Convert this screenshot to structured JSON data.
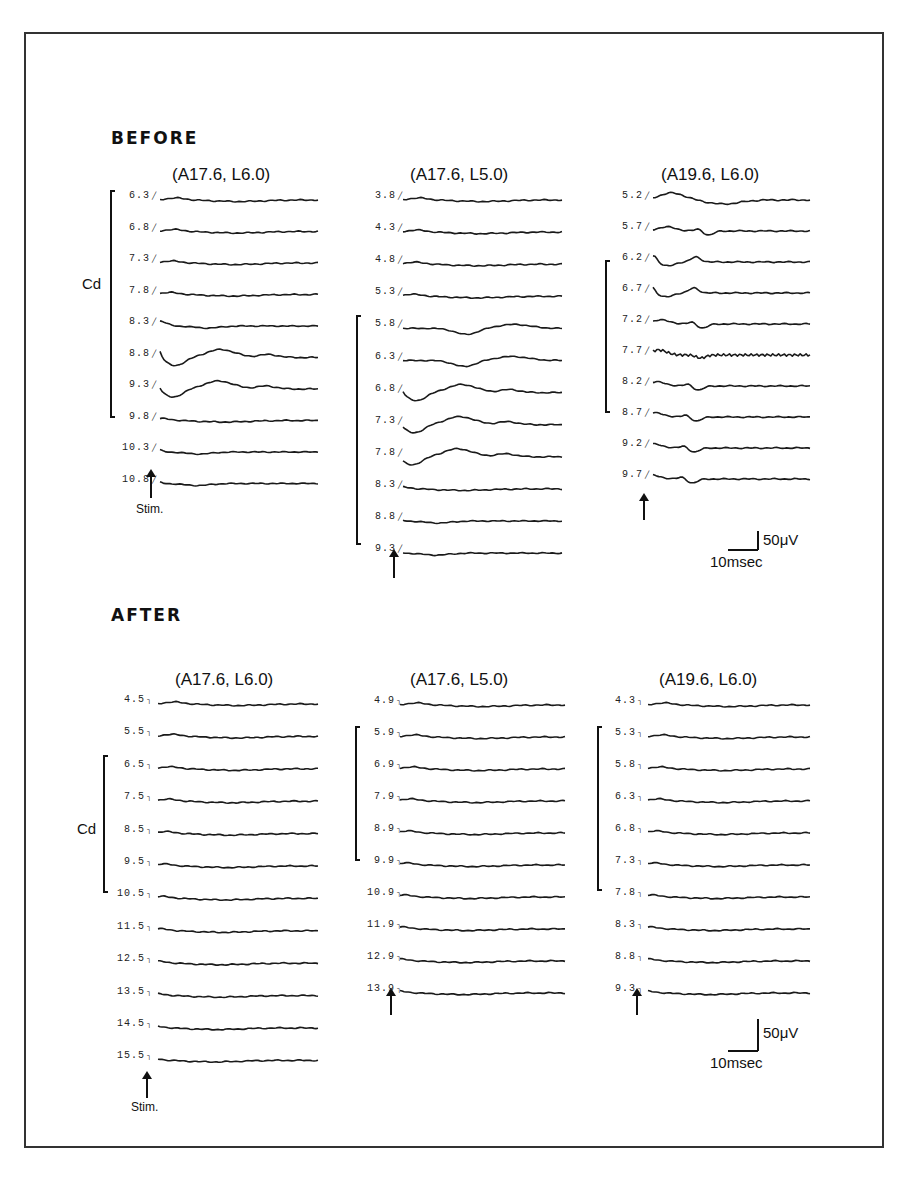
{
  "figure": {
    "sections": [
      {
        "id": "before",
        "title": "BEFORE",
        "columns": [
          {
            "title": "(A17.6, L6.0)",
            "labels": [
              "6.3",
              "6.8",
              "7.3",
              "7.8",
              "8.3",
              "8.8",
              "9.3",
              "9.8",
              "10.3",
              "10.8"
            ],
            "cd_bracket": {
              "from": 0,
              "to": 7
            },
            "cd_label": "Cd",
            "stim_label": "Stim.",
            "response": [
              "flat",
              "flat",
              "flat",
              "flat",
              "small",
              "large",
              "large",
              "flat",
              "small",
              "small"
            ]
          },
          {
            "title": "(A17.6, L5.0)",
            "labels": [
              "3.8",
              "4.3",
              "4.8",
              "5.3",
              "5.8",
              "6.3",
              "6.8",
              "7.3",
              "7.8",
              "8.3",
              "8.8",
              "9.3"
            ],
            "cd_bracket": {
              "from": 4,
              "to": 11
            },
            "response": [
              "flat",
              "flat",
              "flat",
              "flat",
              "dip",
              "dip",
              "large",
              "large",
              "large",
              "flat",
              "small",
              "small"
            ]
          },
          {
            "title": "(A19.6, L6.0)",
            "labels": [
              "5.2",
              "5.7",
              "6.2",
              "6.7",
              "7.2",
              "7.7",
              "8.2",
              "8.7",
              "9.2",
              "9.7"
            ],
            "cd_bracket": {
              "from": 2,
              "to": 7
            },
            "response": [
              "broad",
              "notch",
              "double",
              "double",
              "notch",
              "noisy",
              "notch",
              "notch",
              "notch",
              "notch"
            ]
          }
        ],
        "scale_bar": {
          "amplitude": "50μV",
          "time": "10msec"
        }
      },
      {
        "id": "after",
        "title": "AFTER",
        "columns": [
          {
            "title": "(A17.6, L6.0)",
            "labels": [
              "4.5",
              "5.5",
              "6.5",
              "7.5",
              "8.5",
              "9.5",
              "10.5",
              "11.5",
              "12.5",
              "13.5",
              "14.5",
              "15.5"
            ],
            "cd_bracket": {
              "from": 2,
              "to": 6
            },
            "cd_label": "Cd",
            "stim_label": "Stim."
          },
          {
            "title": "(A17.6, L5.0)",
            "labels": [
              "4.9",
              "5.9",
              "6.9",
              "7.9",
              "8.9",
              "9.9",
              "10.9",
              "11.9",
              "12.9",
              "13.9"
            ],
            "cd_bracket": {
              "from": 1,
              "to": 5
            }
          },
          {
            "title": "(A19.6, L6.0)",
            "labels": [
              "4.3",
              "5.3",
              "5.8",
              "6.3",
              "6.8",
              "7.3",
              "7.8",
              "8.3",
              "8.8",
              "9.3"
            ],
            "cd_bracket": {
              "from": 1,
              "to": 6
            }
          }
        ],
        "scale_bar": {
          "amplitude": "50μV",
          "time": "10msec"
        }
      }
    ]
  }
}
